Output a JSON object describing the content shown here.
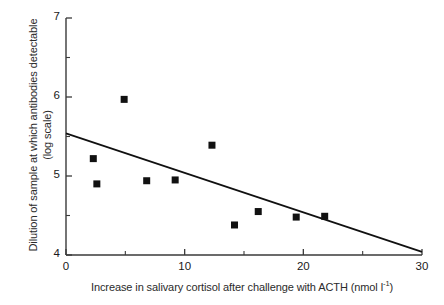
{
  "chart_data": {
    "type": "scatter",
    "title": "",
    "xlabel": "Increase in salivary cortisol after challenge with ACTH (nmol l",
    "xlabel_sup": "-1",
    "xlabel_tail": ")",
    "ylabel_line1": "Dilution of sample at which antibodies detectable",
    "ylabel_line2": "(log scale)",
    "xlim": [
      0,
      30
    ],
    "ylim": [
      4,
      7
    ],
    "grid": false,
    "legend": "none",
    "x_major_ticks": [
      0,
      10,
      20,
      30
    ],
    "x_minor_ticks": [
      5,
      15,
      25
    ],
    "y_major_ticks": [
      4,
      5,
      6,
      7
    ],
    "y_minor_ticks": [
      4.5,
      5.5,
      6.5
    ],
    "x_tick_labels": [
      "0",
      "10",
      "20",
      "30"
    ],
    "y_tick_labels": [
      "4",
      "5",
      "6",
      "7"
    ],
    "marker": "filled-square",
    "marker_color": "#111111",
    "points": [
      {
        "x": 2.3,
        "y": 5.22
      },
      {
        "x": 2.6,
        "y": 4.9
      },
      {
        "x": 4.9,
        "y": 5.97
      },
      {
        "x": 6.8,
        "y": 4.94
      },
      {
        "x": 9.2,
        "y": 4.95
      },
      {
        "x": 12.3,
        "y": 5.39
      },
      {
        "x": 14.2,
        "y": 4.38
      },
      {
        "x": 16.2,
        "y": 4.55
      },
      {
        "x": 19.4,
        "y": 4.48
      },
      {
        "x": 21.8,
        "y": 4.49
      }
    ],
    "trendline": {
      "type": "linear-regression",
      "x_start": 0,
      "y_start": 5.54,
      "x_end": 30,
      "y_end": 4.04,
      "color": "#111111"
    },
    "axis_color": "#3a3a3a"
  }
}
